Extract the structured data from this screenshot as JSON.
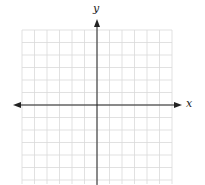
{
  "diagram": {
    "type": "coordinate-grid",
    "x_axis_label": "x",
    "y_axis_label": "y",
    "grid": {
      "columns": 12,
      "rows": 12
    },
    "colors": {
      "grid": "#d9d9d9",
      "axis": "#222222",
      "background": "#ffffff"
    }
  }
}
